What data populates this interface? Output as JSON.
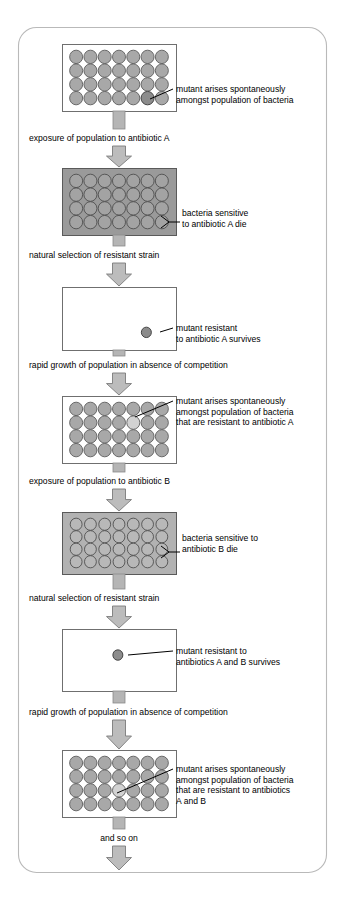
{
  "figure": {
    "frame_color": "#b9b9b9",
    "background": "#ffffff"
  },
  "grid": {
    "columns": 7,
    "rows": 4,
    "cell_color": "#a8a8a8",
    "mutant_dark_color": "#8c8c8c",
    "mutant_light_color": "#d2d2d2"
  },
  "panels": [
    {
      "id": "panel-1",
      "name": "population-with-first-mutant",
      "kind": "grid",
      "shaded": false,
      "mutant": {
        "row": 4,
        "col": 6,
        "shade": "dark"
      },
      "label": {
        "connector": "line",
        "lines": [
          "mutant arises spontaneously",
          "amongst population of bacteria"
        ]
      }
    },
    {
      "id": "panel-2",
      "name": "population-exposed-to-antibiotic-a",
      "kind": "grid",
      "shaded": true,
      "mutant": null,
      "label": {
        "connector": "bracket",
        "lines": [
          "bacteria sensitive",
          "to antibiotic A die"
        ]
      }
    },
    {
      "id": "panel-3",
      "name": "single-resistant-mutant-a",
      "kind": "empty",
      "shaded": false,
      "single_cell": {
        "x_frac": 0.74,
        "y_frac": 0.72
      },
      "label": {
        "connector": "line",
        "lines": [
          "mutant resistant",
          "to antibiotic A survives"
        ]
      }
    },
    {
      "id": "panel-4",
      "name": "resistant-population-with-second-mutant",
      "kind": "grid",
      "shaded": false,
      "mutant": {
        "row": 2,
        "col": 5,
        "shade": "light"
      },
      "label": {
        "connector": "line",
        "lines": [
          "mutant arises spontaneously",
          "amongst population of bacteria",
          "that are resistant to antibiotic A"
        ]
      }
    },
    {
      "id": "panel-5",
      "name": "population-exposed-to-antibiotic-b",
      "kind": "grid",
      "shaded": true,
      "mutant": null,
      "label": {
        "connector": "bracket",
        "lines": [
          "bacteria sensitive to",
          "antibiotic B die"
        ]
      }
    },
    {
      "id": "panel-6",
      "name": "single-resistant-mutant-ab",
      "kind": "empty",
      "shaded": false,
      "single_cell": {
        "x_frac": 0.49,
        "y_frac": 0.42
      },
      "label": {
        "connector": "line",
        "lines": [
          "mutant resistant to",
          "antibiotics A and B survives"
        ]
      }
    },
    {
      "id": "panel-7",
      "name": "double-resistant-population-with-third-mutant",
      "kind": "grid",
      "shaded": false,
      "mutant": {
        "row": 3,
        "col": 4,
        "shade": "light"
      },
      "label": {
        "connector": "line",
        "lines": [
          "mutant arises spontaneously",
          "amongst population of bacteria",
          "that are resistant to antibiotics",
          "A and B"
        ]
      }
    }
  ],
  "steps": [
    {
      "id": "step-1",
      "name": "step-exposure-antibiotic-a",
      "text": "exposure of population to antibiotic A"
    },
    {
      "id": "step-2",
      "name": "step-natural-selection-1",
      "text": "natural selection of resistant strain"
    },
    {
      "id": "step-3",
      "name": "step-rapid-growth-1",
      "text": "rapid growth of population in absence of competition"
    },
    {
      "id": "step-4",
      "name": "step-exposure-antibiotic-b",
      "text": "exposure of population to antibiotic B"
    },
    {
      "id": "step-5",
      "name": "step-natural-selection-2",
      "text": "natural selection of resistant strain"
    },
    {
      "id": "step-6",
      "name": "step-rapid-growth-2",
      "text": "rapid growth of population in absence of competition"
    },
    {
      "id": "step-7",
      "name": "step-and-so-on",
      "text": "and so on"
    }
  ]
}
